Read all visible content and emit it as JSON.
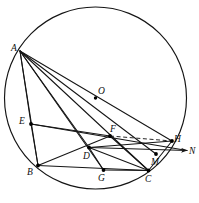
{
  "figure": {
    "type": "geometry-diagram",
    "width": 199,
    "height": 203,
    "background_color": "#ffffff",
    "line_color": "#151515"
  },
  "circle": {
    "name": "circumcircle",
    "center_label": "O",
    "center_x": 95.5,
    "center_y": 98,
    "radius": 91,
    "stroke": "#141414"
  },
  "points": [
    {
      "id": "A",
      "label": "A",
      "x": 20,
      "y": 51,
      "label_x": 11,
      "label_y": 44,
      "on_circle": true,
      "dot": false
    },
    {
      "id": "O",
      "label": "O",
      "x": 95.5,
      "y": 98,
      "label_x": 98,
      "label_y": 87,
      "on_circle": false,
      "dot": true
    },
    {
      "id": "E",
      "label": "E",
      "x": 31,
      "y": 124,
      "label_x": 19,
      "label_y": 117,
      "on_circle": true,
      "dot": true
    },
    {
      "id": "B",
      "label": "B",
      "x": 38,
      "y": 165.5,
      "label_x": 27,
      "label_y": 168,
      "on_circle": true,
      "dot": true
    },
    {
      "id": "D",
      "label": "D",
      "x": 89,
      "y": 147.5,
      "label_x": 83,
      "label_y": 152,
      "on_circle": false,
      "dot": true
    },
    {
      "id": "F",
      "label": "F",
      "x": 110,
      "y": 136,
      "label_x": 110,
      "label_y": 125,
      "on_circle": false,
      "dot": true
    },
    {
      "id": "G",
      "label": "G",
      "x": 103.5,
      "y": 170,
      "label_x": 98,
      "label_y": 174,
      "on_circle": false,
      "dot": true
    },
    {
      "id": "C",
      "label": "C",
      "x": 148.5,
      "y": 170.5,
      "label_x": 145,
      "label_y": 175,
      "on_circle": true,
      "dot": true
    },
    {
      "id": "M",
      "label": "M",
      "x": 156,
      "y": 154,
      "label_x": 151,
      "label_y": 158,
      "on_circle": false,
      "dot": true
    },
    {
      "id": "H",
      "label": "H",
      "x": 172,
      "y": 141,
      "label_x": 174,
      "label_y": 135,
      "on_circle": true,
      "dot": true
    },
    {
      "id": "N",
      "label": "N",
      "x": 187,
      "y": 150.5,
      "label_x": 189,
      "label_y": 147,
      "on_circle": false,
      "dot": false
    }
  ],
  "segments": [
    {
      "id": "A-B",
      "from": "A",
      "to": "B",
      "style": "solid"
    },
    {
      "id": "A-E",
      "from": "A",
      "to": "E",
      "style": "solid"
    },
    {
      "id": "A-D",
      "from": "A",
      "to": "D",
      "style": "solid"
    },
    {
      "id": "A-G",
      "from": "A",
      "to": "G",
      "style": "solid"
    },
    {
      "id": "A-C",
      "from": "A",
      "to": "C",
      "style": "solid"
    },
    {
      "id": "A-M",
      "from": "A",
      "to": "M",
      "style": "solid"
    },
    {
      "id": "A-H",
      "from": "A",
      "to": "H",
      "style": "solid"
    },
    {
      "id": "E-B",
      "from": "E",
      "to": "B",
      "style": "solid"
    },
    {
      "id": "E-F",
      "from": "E",
      "to": "F",
      "style": "solid"
    },
    {
      "id": "E-N",
      "from": "E",
      "to": "N",
      "style": "solid"
    },
    {
      "id": "B-C",
      "from": "B",
      "to": "C",
      "style": "solid"
    },
    {
      "id": "B-F",
      "from": "B",
      "to": "F",
      "style": "solid"
    },
    {
      "id": "D-C",
      "from": "D",
      "to": "C",
      "style": "solid"
    },
    {
      "id": "D-G",
      "from": "D",
      "to": "G",
      "style": "solid"
    },
    {
      "id": "D-H",
      "from": "D",
      "to": "H",
      "style": "solid"
    },
    {
      "id": "F-C",
      "from": "F",
      "to": "C",
      "style": "solid"
    },
    {
      "id": "G-C",
      "from": "G",
      "to": "C",
      "style": "solid"
    },
    {
      "id": "C-H",
      "from": "C",
      "to": "H",
      "style": "solid"
    },
    {
      "id": "F-H",
      "from": "F",
      "to": "H",
      "style": "dashed"
    }
  ],
  "ray": {
    "id": "D-to-N-ray",
    "from": "D",
    "to": "N",
    "arrowhead": true
  }
}
